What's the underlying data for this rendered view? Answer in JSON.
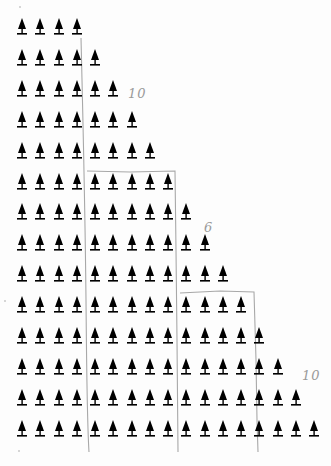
{
  "worksheet": {
    "type": "triangular tree array",
    "row_counts": [
      4,
      5,
      6,
      7,
      8,
      9,
      10,
      11,
      12,
      13,
      14,
      15,
      16,
      17
    ],
    "total_rows": 14,
    "icon": "tree-icon",
    "icon_color": "#000000",
    "pencil_color": "#a8a8a8",
    "annotations": [
      {
        "text": "10",
        "x": 128,
        "y": 88
      },
      {
        "text": "6",
        "x": 204,
        "y": 222
      },
      {
        "text": "10",
        "x": 302,
        "y": 370
      }
    ]
  }
}
